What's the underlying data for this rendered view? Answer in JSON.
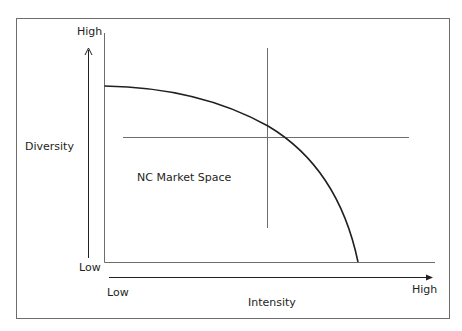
{
  "diagram": {
    "type": "quadrant-frontier",
    "y_axis": {
      "label": "Diversity",
      "high": "High",
      "low": "Low"
    },
    "x_axis": {
      "label": "Intensity",
      "high": "High",
      "low": "Low"
    },
    "region_label": "NC Market Space",
    "elements": [
      "frontier-curve",
      "vertical-divider",
      "horizontal-divider"
    ]
  },
  "colors": {
    "curve": "#231f20",
    "axis": "#6d6d6d",
    "divider": "#6d6d6d",
    "text": "#231f20"
  }
}
